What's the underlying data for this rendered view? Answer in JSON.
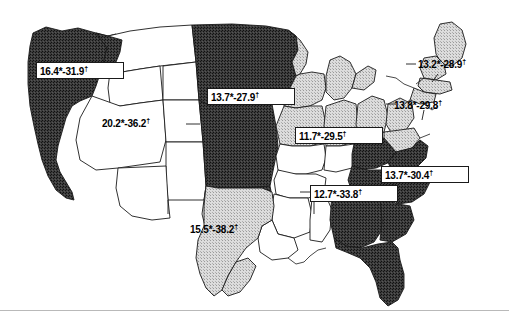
{
  "figure": {
    "type": "choropleth-map",
    "region": "United States (contiguous)",
    "background_color": "#ffffff",
    "line_color": "#1a1a1a"
  },
  "legend_shades": {
    "dark_fill": "#3a3a3a",
    "light_fill": "#d4d4d4",
    "white_fill": "#ffffff"
  },
  "labels": [
    {
      "id": "pacific-northwest",
      "text": "16.4*-31.9",
      "marker": "†",
      "low": 16.4,
      "high": 31.9,
      "shade": "dark",
      "boxed": true,
      "x": 36,
      "y": 62,
      "w": 88,
      "h": 17
    },
    {
      "id": "mountain-west",
      "text": "20.2*-36.2",
      "marker": "†",
      "low": 20.2,
      "high": 36.2,
      "shade": "white",
      "boxed": false,
      "x": 100,
      "y": 116,
      "w": 86,
      "h": 16
    },
    {
      "id": "northern-plains",
      "text": "13.7*-27.9",
      "marker": "†",
      "low": 13.7,
      "high": 27.9,
      "shade": "dark",
      "boxed": true,
      "x": 207,
      "y": 88,
      "w": 88,
      "h": 17
    },
    {
      "id": "great-lakes",
      "text": "11.7*-29.5",
      "marker": "†",
      "low": 11.7,
      "high": 29.5,
      "shade": "light",
      "boxed": true,
      "x": 295,
      "y": 127,
      "w": 88,
      "h": 17
    },
    {
      "id": "south-central",
      "text": "12.7*-33.8",
      "marker": "†",
      "low": 12.7,
      "high": 33.8,
      "shade": "white",
      "boxed": true,
      "x": 310,
      "y": 185,
      "w": 88,
      "h": 17
    },
    {
      "id": "south-texas",
      "text": "15.5*-38.2",
      "marker": "†",
      "low": 15.5,
      "high": 38.2,
      "shade": "light",
      "boxed": false,
      "x": 188,
      "y": 222,
      "w": 86,
      "h": 16
    },
    {
      "id": "southeast",
      "text": "13.7*-30.4",
      "marker": "†",
      "low": 13.7,
      "high": 30.4,
      "shade": "dark",
      "boxed": true,
      "x": 381,
      "y": 166,
      "w": 88,
      "h": 17
    },
    {
      "id": "new-england",
      "text": "13.2*-28.9",
      "marker": "†",
      "low": 13.2,
      "high": 28.9,
      "shade": "light",
      "boxed": false,
      "x": 416,
      "y": 57,
      "w": 86,
      "h": 16
    },
    {
      "id": "mid-atlantic",
      "text": "13.8*-29.8",
      "marker": "†",
      "low": 13.8,
      "high": 29.8,
      "shade": "light",
      "boxed": false,
      "x": 392,
      "y": 98,
      "w": 86,
      "h": 16
    }
  ]
}
